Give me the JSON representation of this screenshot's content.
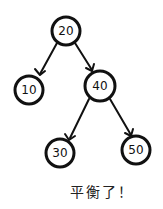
{
  "diagram": {
    "type": "binary-search-tree",
    "colors": {
      "stroke": "#111111",
      "background": "#ffffff"
    },
    "nodes": [
      {
        "id": "n20",
        "label": "20",
        "cx": 66,
        "cy": 31,
        "r": 14
      },
      {
        "id": "n10",
        "label": "10",
        "cx": 29,
        "cy": 90,
        "r": 14
      },
      {
        "id": "n40",
        "label": "40",
        "cx": 100,
        "cy": 86,
        "r": 15
      },
      {
        "id": "n30",
        "label": "30",
        "cx": 60,
        "cy": 153,
        "r": 14
      },
      {
        "id": "n50",
        "label": "50",
        "cx": 136,
        "cy": 150,
        "r": 14
      }
    ],
    "edges": [
      {
        "from": "20",
        "to": "10"
      },
      {
        "from": "20",
        "to": "40"
      },
      {
        "from": "40",
        "to": "30"
      },
      {
        "from": "40",
        "to": "50"
      }
    ],
    "caption": "平衡了！"
  }
}
